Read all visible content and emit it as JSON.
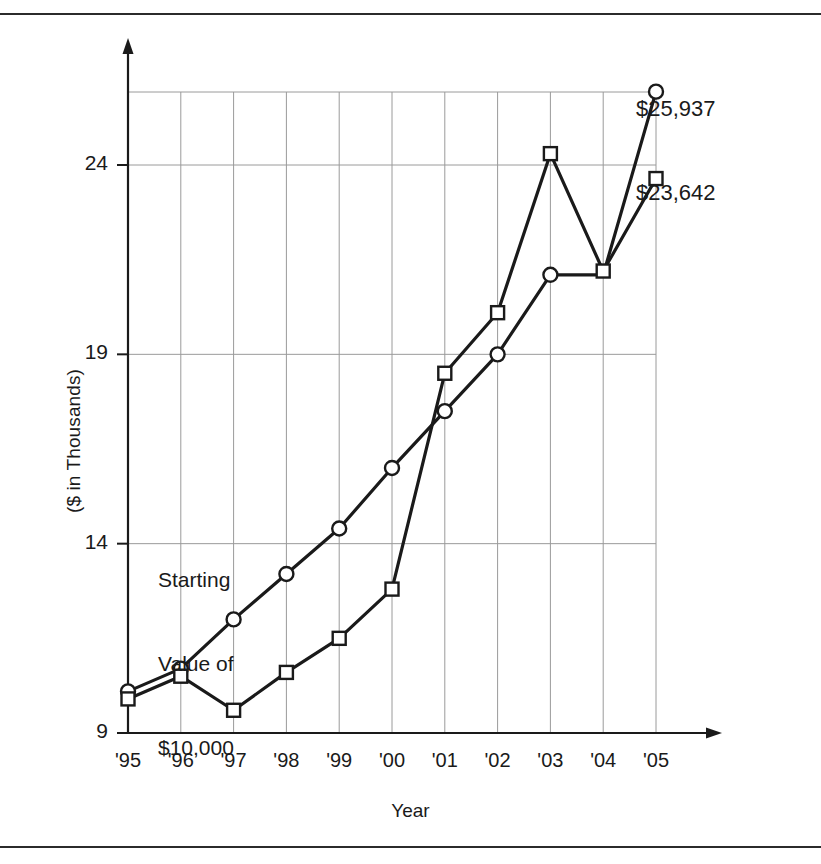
{
  "chart_data": {
    "type": "line",
    "title": "",
    "subtitle": "",
    "xlabel": "Year",
    "ylabel": "($ in Thousands)",
    "categories": [
      "'95",
      "'96",
      "'97",
      "'98",
      "'99",
      "'00",
      "'01",
      "'02",
      "'03",
      "'04",
      "'05"
    ],
    "xlim": [
      0,
      10
    ],
    "ylim": [
      9,
      26.8
    ],
    "yticks": [
      9,
      14,
      19,
      24
    ],
    "ytick_labels": [
      "9",
      "14",
      "19",
      "24"
    ],
    "grid": true,
    "grid_axes": "both",
    "legend": "none",
    "series": [
      {
        "name": "circle-series",
        "marker": "circle",
        "values": [
          10.1,
          10.7,
          12.0,
          13.2,
          14.4,
          16.0,
          17.5,
          19.0,
          21.1,
          21.1,
          25.937
        ],
        "marker_at": [
          true,
          true,
          true,
          true,
          true,
          true,
          true,
          true,
          true,
          false,
          true
        ],
        "end_label": "$25,937"
      },
      {
        "name": "square-series",
        "marker": "square",
        "values": [
          9.9,
          10.5,
          9.6,
          10.6,
          11.5,
          12.8,
          18.5,
          20.1,
          24.3,
          21.2,
          23.642
        ],
        "marker_at": [
          true,
          true,
          true,
          true,
          true,
          true,
          true,
          true,
          true,
          true,
          true
        ],
        "end_label": "$23,642"
      }
    ],
    "annotations": [
      {
        "name": "starting-value-note",
        "text": "Starting\nValue of\n$10,000",
        "lines": [
          "Starting",
          "Value of",
          "$10,000"
        ]
      }
    ],
    "colors": {
      "line": "#1a1a1a",
      "grid": "#9a9a9a",
      "axis": "#1a1a1a",
      "marker_fill": "#ffffff",
      "background": "#ffffff",
      "rule": "#2b2b2b"
    }
  },
  "axis": {
    "ylabel": "($ in Thousands)",
    "xlabel": "Year",
    "yticks": [
      "9",
      "14",
      "19",
      "24"
    ],
    "xticks": [
      "'95",
      "'96",
      "'97",
      "'98",
      "'99",
      "'00",
      "'01",
      "'02",
      "'03",
      "'04",
      "'05"
    ]
  },
  "labels": {
    "series_circle_end": "$25,937",
    "series_square_end": "$23,642",
    "annotation_line_1": "Starting",
    "annotation_line_2": "Value of",
    "annotation_line_3": "$10,000"
  }
}
